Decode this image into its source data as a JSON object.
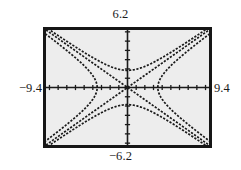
{
  "screen": {
    "kind": "graphing-calculator-screen",
    "window": {
      "xmin": -9.4,
      "xmax": 9.4,
      "ymin": -6.2,
      "ymax": 6.2,
      "xscl": 1,
      "yscl": 1
    },
    "labels": {
      "top": "6.2",
      "bottom": "−6.2",
      "left": "−9.4",
      "right": "9.4"
    },
    "colors": {
      "bezel": "#161616",
      "background": "#ededed",
      "ink": "#1a1a1a"
    }
  },
  "chart_data": {
    "type": "line",
    "title": "",
    "xlabel": "",
    "ylabel": "",
    "xlim": [
      -9.4,
      9.4
    ],
    "ylim": [
      -6.2,
      6.2
    ],
    "grid": false,
    "legend": "none",
    "axis_ticks": {
      "x_step": 1,
      "y_step": 1,
      "x_ticks": [
        -9,
        -8,
        -7,
        -6,
        -5,
        -4,
        -3,
        -2,
        -1,
        1,
        2,
        3,
        4,
        5,
        6,
        7,
        8,
        9
      ],
      "y_ticks": [
        -6,
        -5,
        -4,
        -3,
        -2,
        -1,
        1,
        2,
        3,
        4,
        5,
        6
      ]
    },
    "series": [
      {
        "name": "hyperbola-horizontal-right",
        "style": "dotted",
        "equation": "x^2/3.5^2 - y^2/2.3^2 = 1, x > 0",
        "a": 3.5,
        "b": 2.3,
        "orientation": "horizontal",
        "vertex": [
          3.5,
          0
        ]
      },
      {
        "name": "hyperbola-horizontal-left",
        "style": "dotted",
        "equation": "x^2/3.5^2 - y^2/2.3^2 = 1, x < 0",
        "a": 3.5,
        "b": 2.3,
        "orientation": "horizontal",
        "vertex": [
          -3.5,
          0
        ]
      },
      {
        "name": "hyperbola-vertical-upper",
        "style": "dotted",
        "equation": "y^2/1.85^2 - x^2/2.8^2 = 1, y > 0",
        "a": 1.85,
        "b": 2.8,
        "orientation": "vertical",
        "vertex": [
          0,
          1.85
        ]
      },
      {
        "name": "hyperbola-vertical-lower",
        "style": "dotted",
        "equation": "y^2/1.85^2 - x^2/2.8^2 = 1, y < 0",
        "a": 1.85,
        "b": 2.8,
        "orientation": "vertical",
        "vertex": [
          0,
          -1.85
        ]
      },
      {
        "name": "asymptote-positive-slope",
        "style": "dotted",
        "equation": "y = 0.66x",
        "slope": 0.66
      },
      {
        "name": "asymptote-negative-slope",
        "style": "dotted",
        "equation": "y = -0.66x",
        "slope": -0.66
      }
    ]
  }
}
